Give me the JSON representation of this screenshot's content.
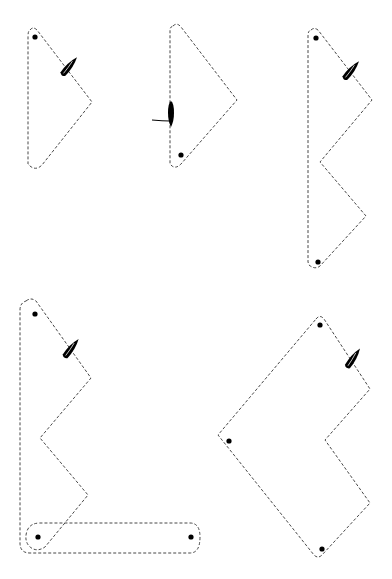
{
  "diagram": {
    "type": "sailing-race-courses",
    "background": "#ffffff",
    "stroke_color": "#333333",
    "courses": [
      {
        "id": "course-1",
        "shape": "triangle",
        "marks": [
          [
            35,
            37
          ]
        ],
        "path": "M 30 30 Q 33 26 37 30 L 92 102 L 42 165 Q 36 171 30 166 L 28 164 L 28 36 Q 28 31 30 30 Z",
        "boat": {
          "x": 68,
          "y": 68,
          "angle": 40,
          "has_line": false
        }
      },
      {
        "id": "course-2",
        "shape": "triangle",
        "marks": [
          [
            181,
            155
          ]
        ],
        "path": "M 173 26 Q 177 22 181 27 L 237 100 L 181 164 Q 176 169 172 166 L 170 164 L 170 30 Q 170 27 173 26 Z",
        "boat": {
          "x": 171,
          "y": 113,
          "angle": 0,
          "has_line": true,
          "line": "M 170 121 Q 163 121 152 120"
        }
      },
      {
        "id": "course-3",
        "shape": "zigzag",
        "marks": [
          [
            316,
            38
          ],
          [
            318,
            262
          ]
        ],
        "path": "M 311 30 Q 314 27 318 30 L 372 100 L 320 162 L 366 216 L 320 266 Q 315 270 309 265 L 308 262 L 308 35 Q 308 31 311 30 Z",
        "boat": {
          "x": 350,
          "y": 72,
          "angle": 40,
          "has_line": false
        }
      },
      {
        "id": "course-4",
        "shape": "zigzag-with-bar",
        "marks": [
          [
            35,
            314
          ],
          [
            38,
            537
          ],
          [
            191,
            537
          ]
        ],
        "path": "M 26 301 Q 31 297 36 301 L 91 378 L 40 438 L 88 495 L 45 547 Q 36 553 29 546 Q 24 540 27 531 Q 30 523 40 523 L 190 523 Q 200 523 200 537 Q 200 553 190 553 L 30 553 Q 20 553 20 543 L 20 310 Q 20 303 26 301 Z",
        "boat": {
          "x": 70,
          "y": 350,
          "angle": 38,
          "has_line": false
        }
      },
      {
        "id": "course-5",
        "shape": "diamond-notch",
        "marks": [
          [
            320,
            325
          ],
          [
            229,
            441
          ],
          [
            322,
            549
          ]
        ],
        "path": "M 316 319 Q 320 314 324 319 L 370 389 L 325 440 L 370 503 L 322 555 Q 318 559 314 555 L 218 435 L 316 319 Z",
        "boat": {
          "x": 352,
          "y": 360,
          "angle": 35,
          "has_line": false
        }
      }
    ]
  }
}
